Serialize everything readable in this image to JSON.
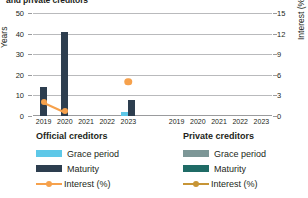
{
  "title": "and private creditors",
  "axes": {
    "left": {
      "label": "Years",
      "ticks": [
        "0",
        "10",
        "20",
        "30",
        "40",
        "50"
      ],
      "min": 0,
      "max": 50
    },
    "right": {
      "label": "Interest (%)",
      "ticks": [
        "0",
        "3",
        "6",
        "9",
        "12",
        "15"
      ],
      "min": 0,
      "max": 15
    }
  },
  "panels": [
    {
      "name": "official",
      "heading": "Official creditors",
      "categories": [
        "2019",
        "2020",
        "2021",
        "2022",
        "2023"
      ]
    },
    {
      "name": "private",
      "heading": "Private creditors",
      "categories": [
        "2019",
        "2020",
        "2021",
        "2022",
        "2023"
      ]
    }
  ],
  "legend": {
    "official": {
      "title": "Official creditors",
      "items": [
        {
          "label": "Grace period",
          "color": "#5ec8e8",
          "type": "bar"
        },
        {
          "label": "Maturity",
          "color": "#2d3e4f",
          "type": "bar"
        },
        {
          "label": "Interest (%)",
          "color": "#f6a14c",
          "type": "line"
        }
      ]
    },
    "private": {
      "title": "Private creditors",
      "items": [
        {
          "label": "Grace period",
          "color": "#7d9797",
          "type": "bar"
        },
        {
          "label": "Maturity",
          "color": "#1f6b66",
          "type": "bar"
        },
        {
          "label": "Interest (%)",
          "color": "#c79536",
          "type": "line"
        }
      ]
    }
  },
  "chart_data": {
    "type": "bar",
    "title": "and private creditors",
    "xlabel": "",
    "ylabel": "Years",
    "y2label": "Interest (%)",
    "ylim": [
      0,
      50
    ],
    "y2lim": [
      0,
      15
    ],
    "grid": true,
    "legend_position": "bottom",
    "categories": [
      "2019",
      "2020",
      "2021",
      "2022",
      "2023"
    ],
    "panels": [
      {
        "name": "Official creditors",
        "series": [
          {
            "name": "Grace period",
            "axis": "left",
            "type": "bar",
            "color": "#5ec8e8",
            "values": [
              0,
              0,
              0,
              0,
              2.0
            ]
          },
          {
            "name": "Maturity",
            "axis": "left",
            "type": "bar",
            "color": "#2d3e4f",
            "values": [
              14.3,
              41.0,
              0,
              0,
              8.0
            ]
          },
          {
            "name": "Interest (%)",
            "axis": "right",
            "type": "line",
            "color": "#f6a14c",
            "values": [
              2.1,
              0.7,
              null,
              null,
              5.0
            ]
          }
        ]
      },
      {
        "name": "Private creditors",
        "series": [
          {
            "name": "Grace period",
            "axis": "left",
            "type": "bar",
            "color": "#7d9797",
            "values": [
              null,
              null,
              null,
              null,
              null
            ]
          },
          {
            "name": "Maturity",
            "axis": "left",
            "type": "bar",
            "color": "#1f6b66",
            "values": [
              null,
              null,
              null,
              null,
              null
            ]
          },
          {
            "name": "Interest (%)",
            "axis": "right",
            "type": "line",
            "color": "#c79536",
            "values": [
              null,
              null,
              null,
              null,
              null
            ]
          }
        ]
      }
    ]
  }
}
